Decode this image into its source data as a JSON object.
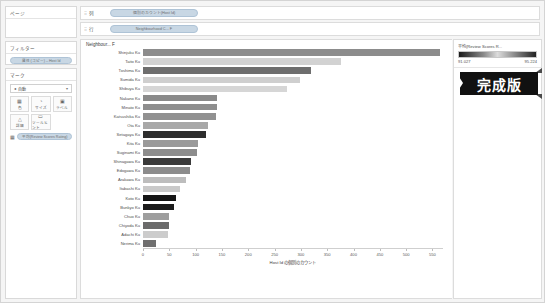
{
  "sidebar": {
    "pages": {
      "title": "ページ"
    },
    "filters": {
      "title": "フィルター",
      "pill": "属性 (コピー) – Host Id"
    },
    "marks": {
      "title": "マーク",
      "type_selected": "自動",
      "caret": "▾",
      "buttons": [
        {
          "name": "color",
          "label": "色",
          "glyph": "▦"
        },
        {
          "name": "size",
          "label": "サイズ",
          "glyph": "◔"
        },
        {
          "name": "label",
          "label": "ラベル",
          "glyph": "▣"
        },
        {
          "name": "detail",
          "label": "詳細",
          "glyph": "△"
        },
        {
          "name": "tooltip",
          "label": "ツールヒント",
          "glyph": "▭"
        }
      ],
      "encoding_pill": "平均(Review Scores Rating)"
    }
  },
  "shelves": [
    {
      "name": "columns",
      "label": "列",
      "grip": "⠿",
      "pill": "個別のカウント(Host Id)"
    },
    {
      "name": "rows",
      "label": "行",
      "grip": "⠿",
      "pill": "Neighbourhood C... F"
    }
  ],
  "viz": {
    "header": "Neighbour... F"
  },
  "legend": {
    "title": "平均(Review Scores R...",
    "min": "91.027",
    "max": "95.224"
  },
  "badge": {
    "text": "完成版"
  },
  "chart_data": {
    "type": "bar",
    "title": "",
    "xlabel": "Host Id の個別のカウント",
    "ylabel": "Neighbourhood Cleansed",
    "orientation": "horizontal",
    "xlim": [
      0,
      570
    ],
    "xticks": [
      0,
      50,
      100,
      150,
      200,
      250,
      300,
      350,
      400,
      450,
      500,
      550
    ],
    "grid": false,
    "legend_position": "right",
    "color_encoding": {
      "field": "平均(Review Scores Rating)",
      "min": 91.027,
      "max": 95.224
    },
    "categories": [
      "Shinjuku Ku",
      "Taito Ku",
      "Toshima Ku",
      "Sumida Ku",
      "Shibuya Ku",
      "Nakano Ku",
      "Minato Ku",
      "Katsushika Ku",
      "Ota Ku",
      "Setagaya Ku",
      "Kita Ku",
      "Suginami Ku",
      "Shinagawa Ku",
      "Edogawa Ku",
      "Arakawa Ku",
      "Itabashi Ku",
      "Koto Ku",
      "Bunkyo Ku",
      "Chuo Ku",
      "Chiyoda Ku",
      "Adachi Ku",
      "Nerima Ku"
    ],
    "values": [
      565,
      377,
      320,
      299,
      273,
      140,
      140,
      139,
      124,
      120,
      104,
      103,
      91,
      89,
      81,
      71,
      62,
      58,
      50,
      50,
      48,
      25
    ],
    "colors": [
      "#8c8c8c",
      "#d2d2d2",
      "#6e6e6e",
      "#cfcfcf",
      "#d6d6d6",
      "#8a8a8a",
      "#8e8e8e",
      "#919191",
      "#a8a8a8",
      "#2e2e2e",
      "#9a9a9a",
      "#8d8d8d",
      "#3a3a3a",
      "#8c8c8c",
      "#bdbdbd",
      "#c9c9c9",
      "#151515",
      "#1c1c1c",
      "#9e9e9e",
      "#6b6b6b",
      "#cccccc",
      "#6f6f6f"
    ]
  }
}
